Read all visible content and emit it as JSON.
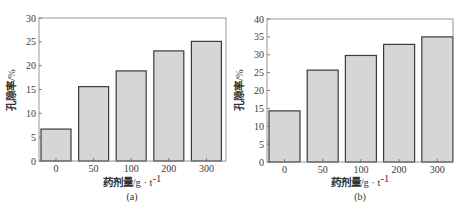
{
  "chart_data": [
    {
      "type": "bar",
      "title": "",
      "caption": "(a)",
      "categories": [
        "0",
        "50",
        "100",
        "200",
        "300"
      ],
      "values": [
        6.7,
        15.6,
        18.9,
        23.1,
        25.1
      ],
      "xlabel": "药剂量/g·t⁻¹",
      "xlabel_main": "药剂量",
      "xlabel_unit": "/g · t",
      "xlabel_sup": "-1",
      "ylabel": "孔隙率/%",
      "ylabel_main": "孔隙率",
      "ylabel_unit": "/%",
      "ylim": [
        0,
        30
      ],
      "yticks": [
        0,
        5,
        10,
        15,
        20,
        25,
        30
      ],
      "grid": false,
      "legend": null
    },
    {
      "type": "bar",
      "title": "",
      "caption": "(b)",
      "categories": [
        "0",
        "50",
        "100",
        "200",
        "300"
      ],
      "values": [
        14.3,
        25.7,
        29.8,
        32.9,
        35.0
      ],
      "xlabel": "药剂量/g·t⁻¹",
      "xlabel_main": "药剂量",
      "xlabel_unit": "/g · t",
      "xlabel_sup": "-1",
      "ylabel": "孔隙率/%",
      "ylabel_main": "孔隙率",
      "ylabel_unit": "/%",
      "ylim": [
        0,
        40
      ],
      "yticks": [
        0,
        5,
        10,
        15,
        20,
        25,
        30,
        35,
        40
      ],
      "grid": false,
      "legend": null
    }
  ],
  "style": {
    "bar_fill": "#d6d6d6",
    "bar_stroke": "#3a3a3a",
    "frame_stroke": "#8a8a8a"
  }
}
